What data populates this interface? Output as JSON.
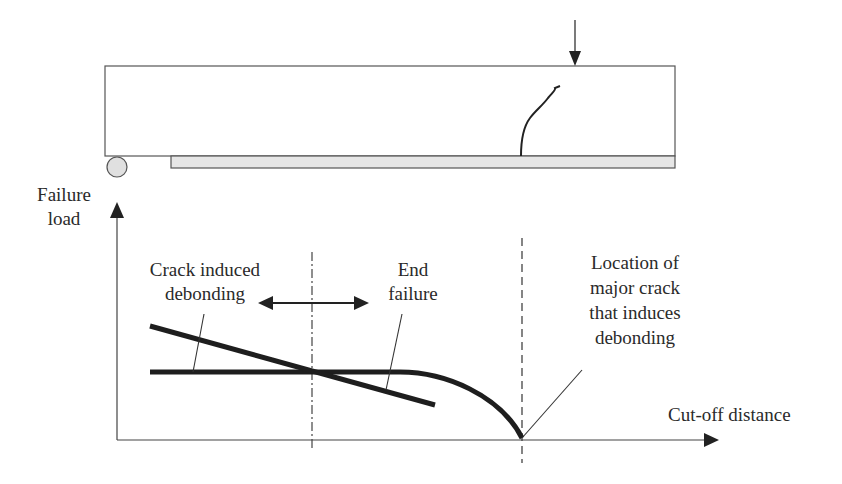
{
  "diagram": {
    "type": "structural-schematic-with-graph",
    "beam": {
      "description": "Simply supported beam strengthened with bonded plate",
      "elements": [
        "beam",
        "roller-support",
        "bonded-plate",
        "point-load",
        "flexural-crack"
      ]
    },
    "graph": {
      "y_axis_label_line1": "Failure",
      "y_axis_label_line2": "load",
      "x_axis_label": "Cut-off distance",
      "crack_induced_line1": "Crack induced",
      "crack_induced_line2": "debonding",
      "end_failure_line1": "End",
      "end_failure_line2": "failure",
      "location_line1": "Location of",
      "location_line2": "major crack",
      "location_line3": "that induces",
      "location_line4": "debonding"
    },
    "colors": {
      "line": "#2a2a2a",
      "thick_curve": "#1e1e1e",
      "plate_fill": "#e6e6e6",
      "roller_fill": "#e0e0e0",
      "background": "#ffffff"
    }
  }
}
